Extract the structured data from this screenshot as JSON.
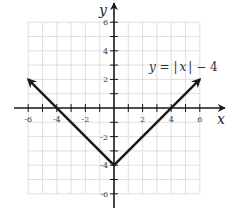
{
  "chart_data": {
    "type": "line",
    "title": "",
    "equation_label": "y = |x| − 4",
    "equation_parts": {
      "y": "y",
      "eq": " = ",
      "bar_l": "|",
      "x": "x",
      "bar_r": "|",
      "rest": " − 4"
    },
    "xlabel": "x",
    "ylabel": "y",
    "xlim": [
      -6,
      6
    ],
    "ylim": [
      -6,
      6
    ],
    "grid": true,
    "x_ticks": [
      -6,
      -5,
      -4,
      -3,
      -2,
      -1,
      1,
      2,
      3,
      4,
      5,
      6
    ],
    "x_tick_labels": [
      "-6",
      "-4",
      "-2",
      "2",
      "4",
      "6"
    ],
    "x_tick_label_values": [
      -6,
      -4,
      -2,
      2,
      4,
      6
    ],
    "y_tick_labels": [
      "6",
      "4",
      "2",
      "-2",
      "-4",
      "-6"
    ],
    "y_tick_label_values": [
      6,
      4,
      2,
      -2,
      -4,
      -6
    ],
    "series": [
      {
        "name": "y = |x| - 4",
        "x": [
          -6,
          0,
          6
        ],
        "y": [
          2,
          -4,
          2
        ],
        "arrows_at_ends": true
      }
    ],
    "key_points": [
      {
        "label": "x-intercept",
        "x": -4,
        "y": 0
      },
      {
        "label": "vertex",
        "x": 0,
        "y": -4
      },
      {
        "label": "x-intercept",
        "x": 4,
        "y": 0
      }
    ]
  },
  "colors": {
    "grid": "#d8d8d8",
    "axis": "#1a1a1a",
    "line": "#1a1a1a",
    "text": "#333333"
  }
}
